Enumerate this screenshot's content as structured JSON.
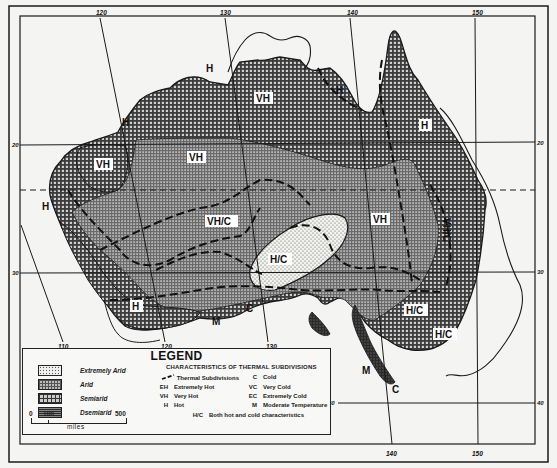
{
  "map": {
    "title": "Thermal and aridity classification of Australia",
    "longitude_labels_top": [
      {
        "label": "120",
        "x": 100,
        "y": 15
      },
      {
        "label": "130",
        "x": 225,
        "y": 15
      },
      {
        "label": "140",
        "x": 350,
        "y": 15
      },
      {
        "label": "150",
        "x": 475,
        "y": 15
      }
    ],
    "longitude_labels_bottom": [
      {
        "label": "110",
        "x": 62,
        "y": 349
      },
      {
        "label": "120",
        "x": 165,
        "y": 349
      },
      {
        "label": "130",
        "x": 270,
        "y": 349
      },
      {
        "label": "140",
        "x": 392,
        "y": 456
      },
      {
        "label": "150",
        "x": 478,
        "y": 456
      }
    ],
    "latitude_labels_left": [
      {
        "label": "20",
        "x": 14,
        "y": 146
      },
      {
        "label": "30",
        "x": 14,
        "y": 273
      }
    ],
    "latitude_labels_right": [
      {
        "label": "20",
        "x": 540,
        "y": 145
      },
      {
        "label": "30",
        "x": 540,
        "y": 274
      },
      {
        "label": "40",
        "x": 540,
        "y": 404
      },
      {
        "label": "40",
        "x": 330,
        "y": 403
      }
    ],
    "region_labels": [
      {
        "text": "VH",
        "x": 263,
        "y": 101
      },
      {
        "text": "VH",
        "x": 196,
        "y": 160
      },
      {
        "text": "VH",
        "x": 103,
        "y": 167
      },
      {
        "text": "VH",
        "x": 381,
        "y": 222
      },
      {
        "text": "VH/C",
        "x": 222,
        "y": 224
      },
      {
        "text": "H/C",
        "x": 280,
        "y": 262
      },
      {
        "text": "H/C",
        "x": 415,
        "y": 313
      },
      {
        "text": "H/C",
        "x": 445,
        "y": 337
      },
      {
        "text": "VH/C",
        "x": 447,
        "y": 235,
        "rotate": 90
      },
      {
        "text": "H",
        "x": 137,
        "y": 310
      },
      {
        "text": "H",
        "x": 426,
        "y": 128
      }
    ],
    "annotations": [
      {
        "text": "H",
        "x": 211,
        "y": 70
      },
      {
        "text": "H",
        "x": 127,
        "y": 124
      },
      {
        "text": "H",
        "x": 47,
        "y": 208
      },
      {
        "text": "H",
        "x": 341,
        "y": 92
      },
      {
        "text": "M",
        "x": 218,
        "y": 323
      },
      {
        "text": "C",
        "x": 252,
        "y": 310
      },
      {
        "text": "M",
        "x": 368,
        "y": 372
      },
      {
        "text": "C",
        "x": 397,
        "y": 391
      }
    ]
  },
  "legend": {
    "title": "LEGEND",
    "moisture_classes": [
      {
        "label": "Extremely Arid",
        "pattern": "dots"
      },
      {
        "label": "Arid",
        "pattern": "fine-grid"
      },
      {
        "label": "Semiarid",
        "pattern": "coarse-grid"
      },
      {
        "label": "Dsemiarid",
        "pattern": "dark-grid"
      }
    ],
    "thermal_title": "CHARACTERISTICS OF THERMAL SUBDIVISIONS",
    "thermal_left": [
      {
        "code": "",
        "label": "Thermal Subdivisions",
        "is_line": true
      },
      {
        "code": "EH",
        "label": "Extremely Hot"
      },
      {
        "code": "VH",
        "label": "Very Hot"
      },
      {
        "code": "H",
        "label": "Hot"
      }
    ],
    "thermal_right": [
      {
        "code": "C",
        "label": "Cold"
      },
      {
        "code": "VC",
        "label": "Very Cold"
      },
      {
        "code": "EC",
        "label": "Extremely Cold"
      },
      {
        "code": "M",
        "label": "Moderate Temperature"
      }
    ],
    "thermal_bottom": {
      "code": "H/C",
      "label": "Both hot and cold characteristics"
    },
    "scale": {
      "start": "0",
      "mid": "100",
      "end": "500",
      "unit": "miles"
    }
  },
  "colors": {
    "ink": "#1a1a1a",
    "paper": "#f4f4f2",
    "arid_fill": "#9a9a9a",
    "semiarid_fill": "#7d7d7d",
    "extremely_arid_fill": "#e4e4e0",
    "dry_fill": "#3a3a3a"
  }
}
